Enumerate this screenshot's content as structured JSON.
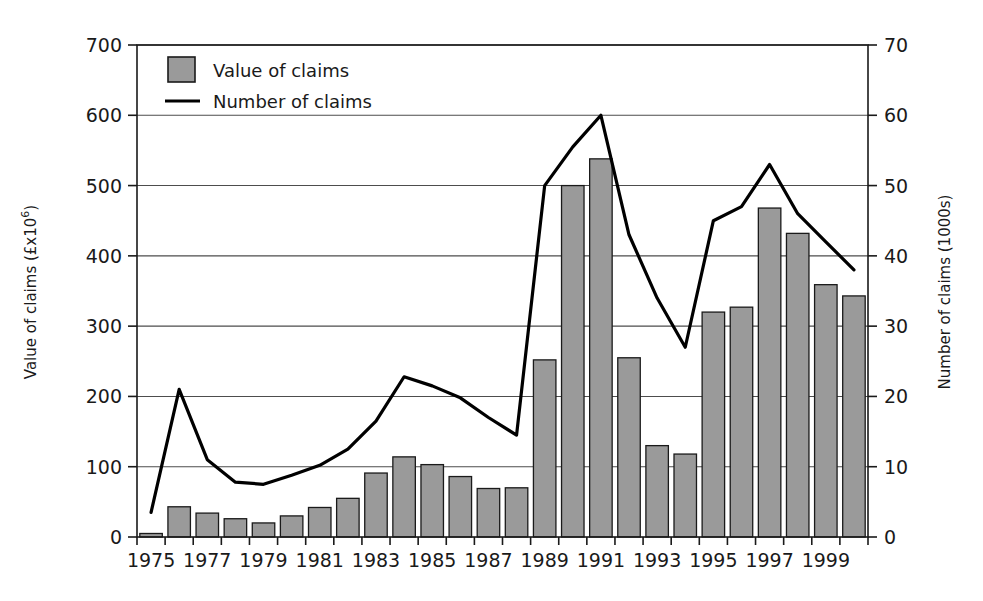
{
  "chart_data": {
    "type": "bar",
    "title": "",
    "subtitle": "",
    "xlabel": "",
    "ylabel": "Value of claims (£x10⁶)",
    "ylabel_main": "Value of claims (£x10",
    "ylabel_exp": "6",
    "ylabel_tail": ")",
    "y2label": "Number of claims (1000s)",
    "ylim": [
      0,
      700
    ],
    "y2lim": [
      0,
      70
    ],
    "yticks": [
      0,
      100,
      200,
      300,
      400,
      500,
      600,
      700
    ],
    "y2ticks": [
      0,
      10,
      20,
      30,
      40,
      50,
      60,
      70
    ],
    "grid": true,
    "legend_position": "top-left",
    "legend": [
      {
        "label": "Value of claims",
        "marker": "swatch",
        "color": "#9a9a9a"
      },
      {
        "label": "Number of claims",
        "marker": "line",
        "color": "#000000"
      }
    ],
    "categories": [
      1975,
      1976,
      1977,
      1978,
      1979,
      1980,
      1981,
      1982,
      1983,
      1984,
      1985,
      1986,
      1987,
      1988,
      1989,
      1990,
      1991,
      1992,
      1993,
      1994,
      1995,
      1996,
      1997,
      1998,
      1999,
      2000
    ],
    "xtick_labels": [
      "1975",
      "",
      "1977",
      "",
      "1979",
      "",
      "1981",
      "",
      "1983",
      "",
      "1985",
      "",
      "1987",
      "",
      "1989",
      "",
      "1991",
      "",
      "1993",
      "",
      "1995",
      "",
      "1997",
      "",
      "1999",
      ""
    ],
    "series": [
      {
        "name": "Value of claims",
        "axis": "left",
        "type": "bar",
        "values": [
          5,
          43,
          34,
          26,
          20,
          30,
          42,
          55,
          91,
          114,
          103,
          86,
          69,
          70,
          252,
          500,
          538,
          255,
          130,
          118,
          320,
          327,
          468,
          432,
          359,
          343
        ]
      },
      {
        "name": "Number of claims",
        "axis": "right",
        "type": "line",
        "values": [
          3.5,
          21,
          11,
          7.8,
          7.5,
          8.8,
          10.2,
          12.5,
          16.5,
          22.8,
          21.5,
          19.8,
          17,
          14.5,
          50,
          55.5,
          60,
          43,
          34,
          27,
          45,
          47,
          53,
          46,
          42,
          38
        ]
      }
    ]
  },
  "colors": {
    "bar_fill": "#9a9a9a",
    "bar_stroke": "#1a1a1a",
    "line": "#000000",
    "grid": "#4d4d4d",
    "frame": "#1a1a1a",
    "text": "#1a1a1a",
    "background": "#ffffff"
  }
}
